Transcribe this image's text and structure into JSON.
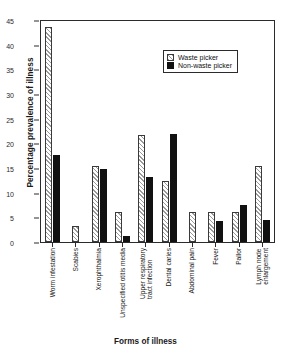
{
  "chart_data": {
    "type": "bar",
    "title": "",
    "xlabel": "Forms of illness",
    "ylabel": "Percentage prevalence of illness",
    "ylim": [
      0,
      45
    ],
    "ytick_step": 5,
    "yticks": [
      0,
      5,
      10,
      15,
      20,
      25,
      30,
      35,
      40,
      45
    ],
    "grid": false,
    "legend_position": "top-right",
    "categories": [
      "Worm infestation",
      "Scabies",
      "Xerophthalmia",
      "Unspecified otitis media",
      "Upper respiratory tract infection",
      "Dental caries",
      "Abdominal pain",
      "Fever",
      "Pallor",
      "Lymph node enlargement"
    ],
    "category_lines": [
      [
        "Worm infestation",
        ""
      ],
      [
        "Scabies",
        ""
      ],
      [
        "Xerophthalmia",
        ""
      ],
      [
        "Unspecified otitis media",
        ""
      ],
      [
        "Upper respiratory",
        "tract infection"
      ],
      [
        "Dental caries",
        ""
      ],
      [
        "Abdominal pain",
        ""
      ],
      [
        "Fever",
        ""
      ],
      [
        "Pallor",
        ""
      ],
      [
        "Lymph node",
        "enlargement"
      ]
    ],
    "series": [
      {
        "name": "Waste picker",
        "pattern": "diagonal-hatch",
        "color": "#ffffff",
        "values": [
          43.8,
          3.2,
          15.5,
          6.2,
          21.8,
          12.5,
          6.2,
          6.2,
          6.2,
          15.5
        ]
      },
      {
        "name": "Non-waste picker",
        "pattern": "solid",
        "color": "#111111",
        "values": [
          17.7,
          0,
          14.8,
          1.3,
          13.2,
          22.0,
          0,
          4.3,
          7.5,
          4.4
        ]
      }
    ]
  },
  "legend": {
    "items": [
      {
        "label": "Waste picker"
      },
      {
        "label": "Non-waste picker"
      }
    ]
  }
}
